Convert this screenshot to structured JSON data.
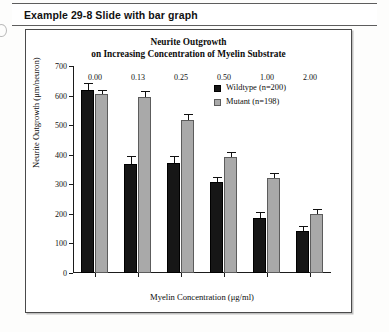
{
  "header": {
    "label": "Example 29-8  Slide with bar graph"
  },
  "chart_box": {
    "border_color": "#4a4a4a"
  },
  "chart_data": {
    "type": "bar",
    "title": "Neurite Outgrowth on Increasing Concentration of Myelin Substrate",
    "title_line1": "Neurite Outgrowth",
    "title_line2": "on Increasing Concentration of Myelin Substrate",
    "xlabel": "Myelin Concentration (μg/ml)",
    "ylabel": "Neurite Outgrowth (μm/neuron)",
    "categories": [
      "0.00",
      "0.13",
      "0.25",
      "0.50",
      "1.00",
      "2.00"
    ],
    "ylim": [
      0,
      700
    ],
    "yticks": [
      0,
      100,
      200,
      300,
      400,
      500,
      600,
      700
    ],
    "ytick_labels": [
      "0",
      "100",
      "200",
      "300",
      "400",
      "500",
      "600",
      "700"
    ],
    "grid": false,
    "legend_position": "upper right",
    "series": [
      {
        "name": "Wildtype (n=200)",
        "color": "#161616",
        "values": [
          620,
          370,
          372,
          307,
          185,
          142
        ],
        "errors": [
          22,
          24,
          22,
          16,
          20,
          16
        ]
      },
      {
        "name": "Mutant (n=198)",
        "color": "#a9a9a9",
        "values": [
          605,
          595,
          518,
          392,
          320,
          200
        ],
        "errors": [
          14,
          22,
          18,
          16,
          18,
          18
        ]
      }
    ]
  }
}
